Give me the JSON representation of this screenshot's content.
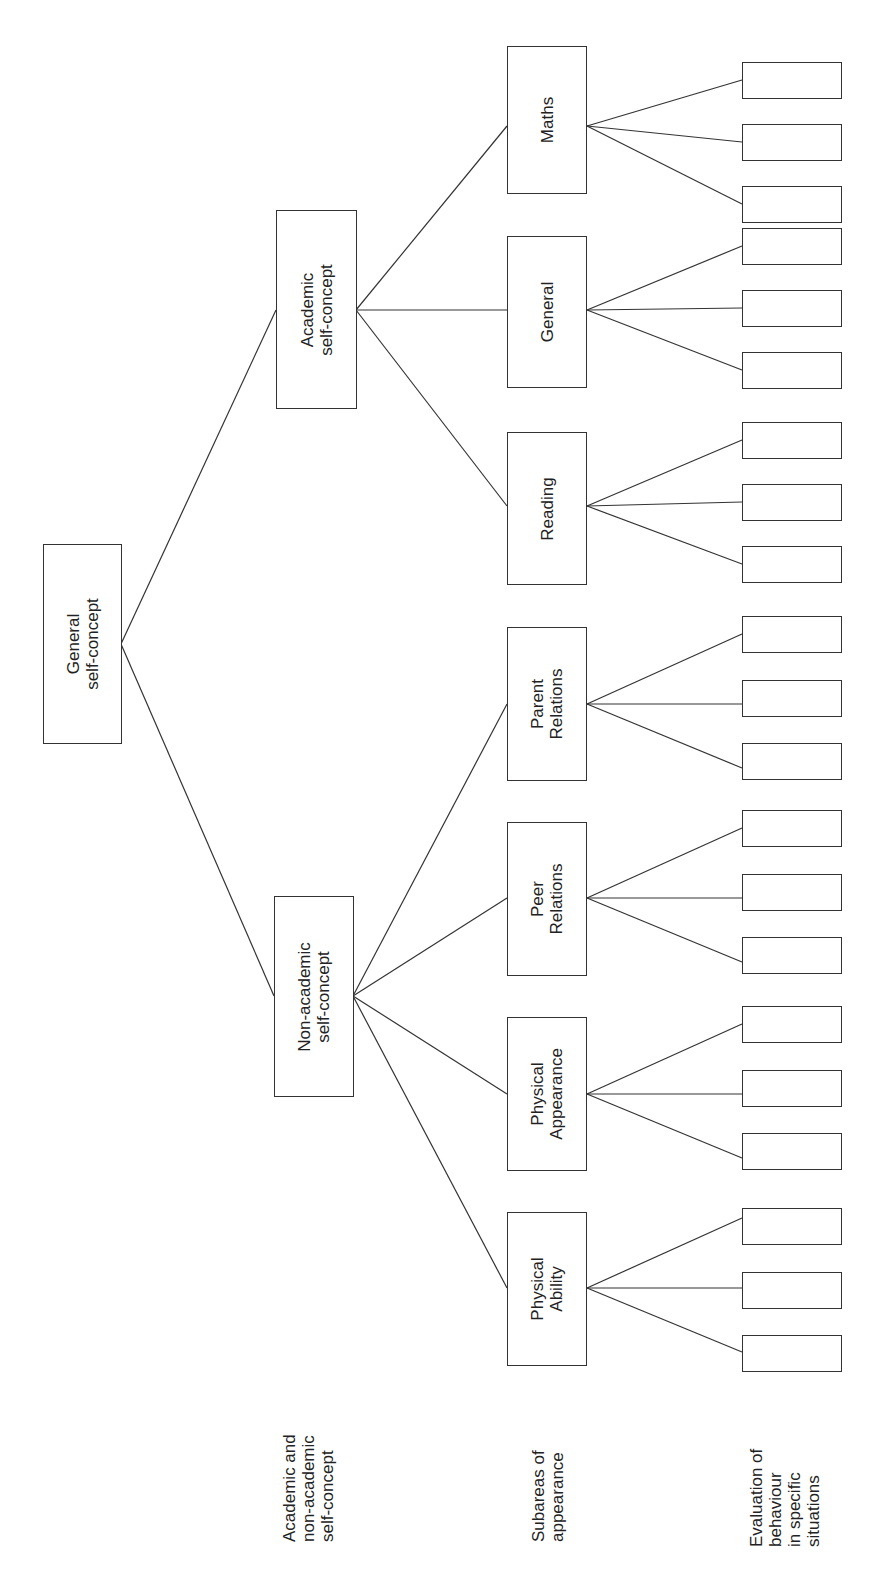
{
  "diagram": {
    "type": "hierarchy-tree",
    "orientation": "rotated-90-ccw",
    "root": {
      "id": "general",
      "label": "General\nself-concept",
      "lines": [
        "General",
        "self-concept"
      ]
    },
    "level2": [
      {
        "id": "academic",
        "lines": [
          "Academic",
          "self-concept"
        ]
      },
      {
        "id": "non-academic",
        "lines": [
          "Non-academic",
          "self-concept"
        ]
      }
    ],
    "level3": [
      {
        "id": "maths",
        "parent": "academic",
        "lines": [
          "Maths"
        ]
      },
      {
        "id": "general-academic",
        "parent": "academic",
        "lines": [
          "General"
        ]
      },
      {
        "id": "reading",
        "parent": "academic",
        "lines": [
          "Reading"
        ]
      },
      {
        "id": "parent-relations",
        "parent": "non-academic",
        "lines": [
          "Parent",
          "Relations"
        ]
      },
      {
        "id": "peer-relations",
        "parent": "non-academic",
        "lines": [
          "Peer",
          "Relations"
        ]
      },
      {
        "id": "physical-appearance",
        "parent": "non-academic",
        "lines": [
          "Physical",
          "Appearance"
        ]
      },
      {
        "id": "physical-ability",
        "parent": "non-academic",
        "lines": [
          "Physical",
          "Ability"
        ]
      }
    ],
    "leaves_per_subarea": 3,
    "leaf_label": "",
    "row_labels": [
      {
        "id": "row-level2",
        "lines": [
          "Academic and",
          "non-academic",
          "self-concept"
        ]
      },
      {
        "id": "row-level3",
        "lines": [
          "Subareas of",
          "appearance"
        ]
      },
      {
        "id": "row-level4",
        "lines": [
          "Evaluation of",
          "behaviour",
          "in specific",
          "situations"
        ]
      }
    ],
    "colors": {
      "line": "#333333",
      "box_border": "#333333",
      "shadow": "#bdbdbd",
      "background": "#ffffff"
    }
  }
}
